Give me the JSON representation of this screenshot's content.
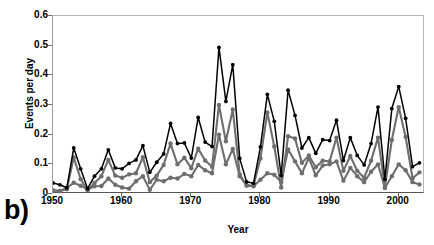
{
  "figure": {
    "panel_label": "b)",
    "ylabel": "Events per day",
    "xlabel": "Year"
  },
  "colors": {
    "series_total": "#000000",
    "series_mid": "#6e6e6e",
    "series_low": "#6e6e6e",
    "axis": "#555555",
    "frame": "#b5b5b5",
    "background": "#ffffff"
  },
  "chart_data": {
    "type": "line",
    "title": "",
    "xlabel": "Year",
    "ylabel": "Events per day",
    "xlim": [
      1950,
      2003.8
    ],
    "ylim": [
      0,
      0.6
    ],
    "xticks": [
      1950,
      1960,
      1970,
      1980,
      1990,
      2000
    ],
    "xtick_labels": [
      "1950",
      "1960",
      "1970",
      "1980",
      "1990",
      "2000"
    ],
    "yticks": [
      0,
      0.1,
      0.2,
      0.3,
      0.4,
      0.5,
      0.6
    ],
    "ytick_labels": [
      "0",
      "0.1",
      "0.2",
      "0.3",
      "0.4",
      "0.5",
      "0.6"
    ],
    "grid": false,
    "legend": null,
    "markers": "circle",
    "x": [
      1950,
      1951,
      1952,
      1953,
      1954,
      1955,
      1956,
      1957,
      1958,
      1959,
      1960,
      1961,
      1962,
      1963,
      1964,
      1965,
      1966,
      1967,
      1968,
      1969,
      1970,
      1971,
      1972,
      1973,
      1974,
      1975,
      1976,
      1977,
      1978,
      1979,
      1980,
      1981,
      1982,
      1983,
      1984,
      1985,
      1986,
      1987,
      1988,
      1989,
      1990,
      1991,
      1992,
      1993,
      1994,
      1995,
      1996,
      1997,
      1998,
      1999,
      2000,
      2001,
      2002,
      2003
    ],
    "series": [
      {
        "name": "upper-black",
        "color": "#000000",
        "values": [
          0.037,
          0.031,
          0.021,
          0.155,
          0.085,
          0.018,
          0.06,
          0.085,
          0.149,
          0.088,
          0.085,
          0.103,
          0.115,
          0.163,
          0.073,
          0.107,
          0.135,
          0.238,
          0.17,
          0.172,
          0.121,
          0.258,
          0.175,
          0.16,
          0.494,
          0.312,
          0.436,
          0.12,
          0.041,
          0.036,
          0.159,
          0.336,
          0.245,
          0.062,
          0.35,
          0.265,
          0.155,
          0.19,
          0.137,
          0.183,
          0.18,
          0.249,
          0.113,
          0.19,
          0.13,
          0.098,
          0.17,
          0.293,
          0.05,
          0.288,
          0.362,
          0.255,
          0.092,
          0.105
        ]
      },
      {
        "name": "middle-gray",
        "color": "#6e6e6e",
        "values": [
          0.013,
          0.01,
          0.016,
          0.123,
          0.05,
          0.012,
          0.037,
          0.06,
          0.115,
          0.062,
          0.055,
          0.066,
          0.07,
          0.124,
          0.04,
          0.062,
          0.098,
          0.17,
          0.1,
          0.122,
          0.087,
          0.153,
          0.113,
          0.092,
          0.3,
          0.178,
          0.285,
          0.066,
          0.028,
          0.028,
          0.12,
          0.275,
          0.16,
          0.022,
          0.195,
          0.187,
          0.105,
          0.13,
          0.09,
          0.112,
          0.11,
          0.19,
          0.078,
          0.128,
          0.078,
          0.055,
          0.112,
          0.19,
          0.022,
          0.182,
          0.293,
          0.192,
          0.053,
          0.073
        ]
      },
      {
        "name": "lower-gray",
        "color": "#6e6e6e",
        "values": [
          0.012,
          0.01,
          0.02,
          0.038,
          0.028,
          0.015,
          0.026,
          0.027,
          0.052,
          0.031,
          0.022,
          0.018,
          0.043,
          0.06,
          0.014,
          0.048,
          0.043,
          0.055,
          0.052,
          0.068,
          0.06,
          0.098,
          0.08,
          0.07,
          0.2,
          0.1,
          0.152,
          0.06,
          0.03,
          0.026,
          0.048,
          0.07,
          0.065,
          0.04,
          0.15,
          0.11,
          0.07,
          0.122,
          0.063,
          0.096,
          0.1,
          0.11,
          0.045,
          0.088,
          0.06,
          0.04,
          0.075,
          0.1,
          0.02,
          0.06,
          0.1,
          0.08,
          0.04,
          0.032
        ]
      }
    ]
  }
}
